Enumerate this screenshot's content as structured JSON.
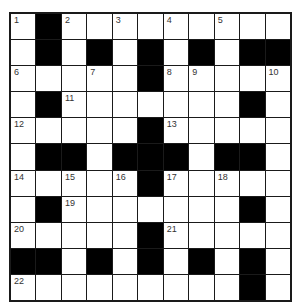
{
  "puzzle": {
    "rows": 11,
    "cols": 11,
    "colors": {
      "block": "#000000",
      "cell": "#ffffff",
      "line": "#1a1a1a",
      "number": "#333333"
    },
    "grid": [
      [
        "1",
        "#",
        "2",
        "",
        "3",
        "",
        "4",
        "",
        "5",
        "",
        ""
      ],
      [
        "",
        "#",
        "",
        "#",
        "",
        "#",
        "",
        "#",
        "",
        "#",
        "#"
      ],
      [
        "6",
        "",
        "",
        "7",
        "",
        "#",
        "8",
        "9",
        "",
        "",
        "10"
      ],
      [
        "",
        "#",
        "11",
        "",
        "",
        "",
        "",
        "",
        "",
        "#",
        ""
      ],
      [
        "12",
        "",
        "",
        "",
        "",
        "#",
        "13",
        "",
        "",
        "",
        ""
      ],
      [
        "",
        "#",
        "#",
        "",
        "#",
        "#",
        "#",
        "",
        "#",
        "#",
        ""
      ],
      [
        "14",
        "",
        "15",
        "",
        "16",
        "#",
        "17",
        "",
        "18",
        "",
        ""
      ],
      [
        "",
        "#",
        "19",
        "",
        "",
        "",
        "",
        "",
        "",
        "#",
        ""
      ],
      [
        "20",
        "",
        "",
        "",
        "",
        "#",
        "21",
        "",
        "",
        "",
        ""
      ],
      [
        "#",
        "#",
        "",
        "#",
        "",
        "#",
        "",
        "#",
        "",
        "#",
        ""
      ],
      [
        "22",
        "",
        "",
        "",
        "",
        "",
        "",
        "",
        "",
        "#",
        ""
      ]
    ]
  }
}
